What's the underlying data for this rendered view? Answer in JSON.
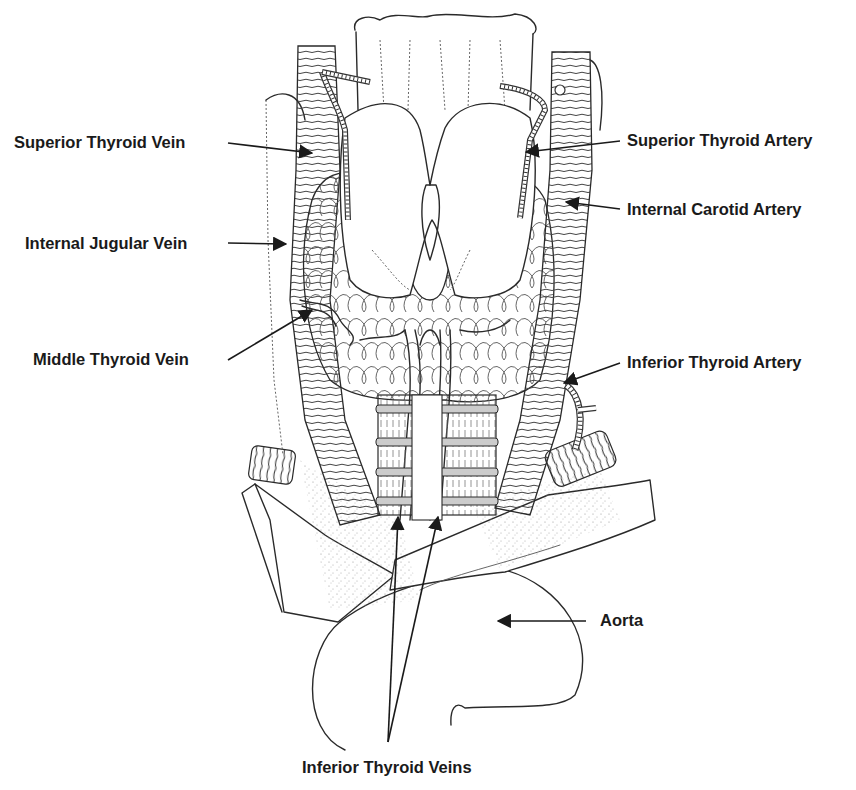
{
  "diagram": {
    "labels": {
      "superior_thyroid_vein": "Superior Thyroid Vein",
      "internal_jugular_vein": "Internal Jugular Vein",
      "middle_thyroid_vein": "Middle Thyroid Vein",
      "superior_thyroid_artery": "Superior Thyroid Artery",
      "internal_carotid_artery": "Internal Carotid Artery",
      "inferior_thyroid_artery": "Inferior Thyroid Artery",
      "aorta": "Aorta",
      "inferior_thyroid_veins": "Inferior Thyroid Veins"
    },
    "colors": {
      "line": "#2a2a2a",
      "text": "#1a1a1a",
      "background": "#ffffff"
    }
  }
}
